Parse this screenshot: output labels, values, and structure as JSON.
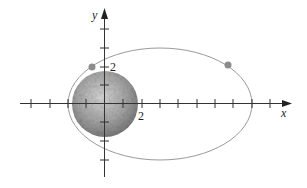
{
  "figure": {
    "x_axis_label": "x",
    "y_axis_label": "y",
    "x_tick_label": "2",
    "y_tick_label": "2",
    "colors": {
      "axis": "#333333",
      "orbit": "#9a9a9a",
      "satellite": "#8c8c8c",
      "moon_light": "#cfcfcf",
      "moon_dark": "#7a7a7a"
    },
    "objects": [
      {
        "name": "moon",
        "shape": "circle",
        "center": [
          0,
          0
        ],
        "radius": 1.75
      },
      {
        "name": "orbit",
        "shape": "ellipse",
        "center": [
          3,
          0
        ],
        "semi_axes": [
          5,
          3
        ]
      },
      {
        "name": "satellite-point-1",
        "shape": "point",
        "position": [
          -0.7,
          2
        ]
      },
      {
        "name": "satellite-point-2",
        "shape": "point",
        "position": [
          6.7,
          2
        ]
      }
    ]
  }
}
